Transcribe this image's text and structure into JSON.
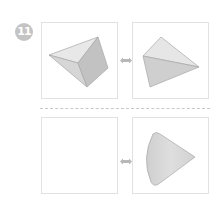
{
  "problem": {
    "number": "11"
  },
  "rows": [
    {
      "left": {
        "shape": "triangular-pyramid-view-a"
      },
      "arrow": "double-arrow-icon",
      "right": {
        "shape": "triangular-pyramid-view-b"
      }
    },
    {
      "left": {
        "shape": "empty"
      },
      "arrow": "double-arrow-icon",
      "right": {
        "shape": "cone-view"
      }
    }
  ],
  "colors": {
    "badge": "#c4c4c4",
    "box_border": "#e2e2e2",
    "face_light": "#e6e6e6",
    "face_mid": "#d4d4d4",
    "face_dark": "#c2c2c2",
    "edge": "#a8a8a8",
    "arrow": "#b8b8b8",
    "dash": "#c8c8c8"
  }
}
